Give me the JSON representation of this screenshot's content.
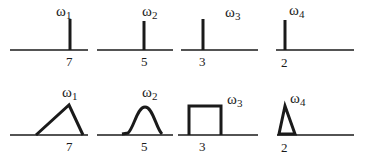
{
  "diagram": {
    "colors": {
      "ink": "#1a1a1a",
      "background": "#ffffff"
    },
    "top_row": {
      "type": "crisp-spikes",
      "panels": [
        {
          "symbol": "ω",
          "subscript": "1",
          "tick": "7"
        },
        {
          "symbol": "ω",
          "subscript": "2",
          "tick": "5"
        },
        {
          "symbol": "ω",
          "subscript": "3",
          "tick": "3"
        },
        {
          "symbol": "ω",
          "subscript": "4",
          "tick": "2"
        }
      ]
    },
    "bottom_row": {
      "type": "membership-shapes",
      "panels": [
        {
          "symbol": "ω",
          "subscript": "1",
          "tick": "7",
          "shape": "asymmetric-triangle"
        },
        {
          "symbol": "ω",
          "subscript": "2",
          "tick": "5",
          "shape": "bell-curve"
        },
        {
          "symbol": "ω",
          "subscript": "3",
          "tick": "3",
          "shape": "rectangle"
        },
        {
          "symbol": "ω",
          "subscript": "4",
          "tick": "2",
          "shape": "narrow-triangle"
        }
      ]
    }
  }
}
